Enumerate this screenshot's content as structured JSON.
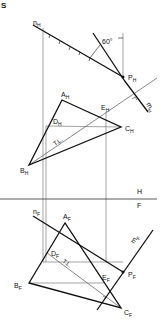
{
  "figure": {
    "corner_label": "S",
    "angle_label": "60°",
    "fold_line": {
      "top": "H",
      "bottom": "F"
    },
    "top_view": {
      "n": {
        "base": "n",
        "sub": "H"
      },
      "m": {
        "base": "m",
        "sub": "H"
      },
      "P": {
        "base": "P",
        "sub": "H"
      },
      "A": {
        "base": "A",
        "sub": "H"
      },
      "B": {
        "base": "B",
        "sub": "H"
      },
      "C": {
        "base": "C",
        "sub": "H"
      },
      "D": {
        "base": "D",
        "sub": "H"
      },
      "E": {
        "base": "E",
        "sub": "H"
      },
      "true_length": "T.L."
    },
    "front_view": {
      "n": {
        "base": "n",
        "sub": "F"
      },
      "m": {
        "base": "m",
        "sub": "F"
      },
      "P": {
        "base": "P",
        "sub": "F"
      },
      "A": {
        "base": "A",
        "sub": "F"
      },
      "B": {
        "base": "B",
        "sub": "F"
      },
      "C": {
        "base": "C",
        "sub": "F"
      },
      "D": {
        "base": "D",
        "sub": "F"
      },
      "E": {
        "base": "E",
        "sub": "F"
      },
      "true_length": "T.L."
    },
    "colors": {
      "line": "#111111",
      "thin": "#555555",
      "background": "#ffffff"
    }
  }
}
